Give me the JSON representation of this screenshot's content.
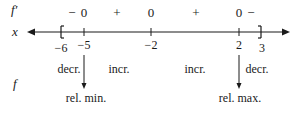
{
  "labels": {
    "fprime": "f′",
    "x": "x",
    "f": "f"
  },
  "critical_points": [
    {
      "value": "−6",
      "kind": "left-endpoint-bracket"
    },
    {
      "value": "−5",
      "kind": "critical"
    },
    {
      "value": "−2",
      "kind": "critical"
    },
    {
      "value": "2",
      "kind": "critical"
    },
    {
      "value": "3",
      "kind": "right-endpoint-bracket"
    }
  ],
  "sign_row": [
    {
      "text": "−",
      "at": "between −6 and −5"
    },
    {
      "text": "0",
      "at": "−5"
    },
    {
      "text": "+",
      "at": "between −5 and −2"
    },
    {
      "text": "0",
      "at": "−2"
    },
    {
      "text": "+",
      "at": "between −2 and 2"
    },
    {
      "text": "0",
      "at": "2"
    },
    {
      "text": "−",
      "at": "between 2 and 3"
    }
  ],
  "behavior_row": [
    {
      "text": "decr."
    },
    {
      "text": "incr."
    },
    {
      "text": "incr."
    },
    {
      "text": "decr."
    }
  ],
  "extrema": [
    {
      "text": "rel. min.",
      "at": "−5"
    },
    {
      "text": "rel. max.",
      "at": "2"
    }
  ],
  "colors": {
    "ink": "#1a1a1a",
    "background": "#ffffff"
  }
}
